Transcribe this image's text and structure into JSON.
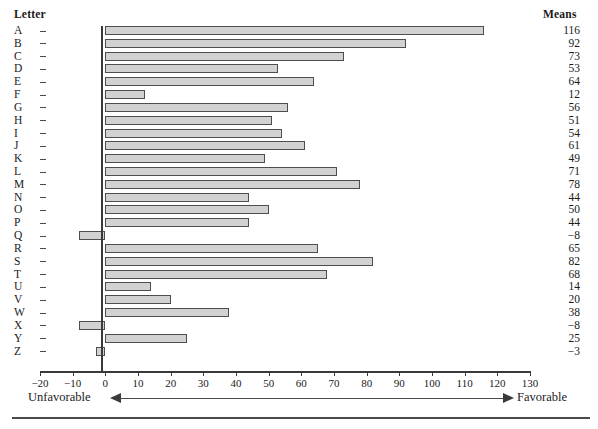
{
  "headers": {
    "letter": "Letter",
    "means": "Means"
  },
  "annotations": {
    "left_label": "Unfavorable",
    "right_label": "Favorable",
    "left_arrow_icon": "arrow-left-icon",
    "right_arrow_icon": "arrow-right-icon"
  },
  "colors": {
    "bar_fill": "#d2d2d2",
    "bar_border": "#4d4d4d",
    "axis": "#3a3a3a",
    "text": "#1a1a1a",
    "background": "#ffffff"
  },
  "chart_data": {
    "type": "bar",
    "orientation": "horizontal",
    "title": "",
    "subtitle": "",
    "xlabel": "",
    "ylabel": "Letter",
    "value_column_label": "Means",
    "xlim": [
      -20,
      130
    ],
    "xticks": [
      -20,
      -10,
      0,
      10,
      20,
      30,
      40,
      50,
      60,
      70,
      80,
      90,
      100,
      110,
      120,
      130
    ],
    "xtick_labels": [
      "−20",
      "−10",
      "0",
      "10",
      "20",
      "30",
      "40",
      "50",
      "60",
      "70",
      "80",
      "90",
      "100",
      "110",
      "120",
      "130"
    ],
    "grid": false,
    "legend": null,
    "zero_reference_line": 0,
    "categories": [
      "A",
      "B",
      "C",
      "D",
      "E",
      "F",
      "G",
      "H",
      "I",
      "J",
      "K",
      "L",
      "M",
      "N",
      "O",
      "P",
      "Q",
      "R",
      "S",
      "T",
      "U",
      "V",
      "W",
      "X",
      "Y",
      "Z"
    ],
    "values": [
      116,
      92,
      73,
      53,
      64,
      12,
      56,
      51,
      54,
      61,
      49,
      71,
      78,
      44,
      50,
      44,
      -8,
      65,
      82,
      68,
      14,
      20,
      38,
      -8,
      25,
      -3
    ],
    "value_labels": [
      "116",
      "92",
      "73",
      "53",
      "64",
      "12",
      "56",
      "51",
      "54",
      "61",
      "49",
      "71",
      "78",
      "44",
      "50",
      "44",
      "−8",
      "65",
      "82",
      "68",
      "14",
      "20",
      "38",
      "−8",
      "25",
      "−3"
    ],
    "annotations": [
      "Unfavorable",
      "Favorable"
    ]
  }
}
